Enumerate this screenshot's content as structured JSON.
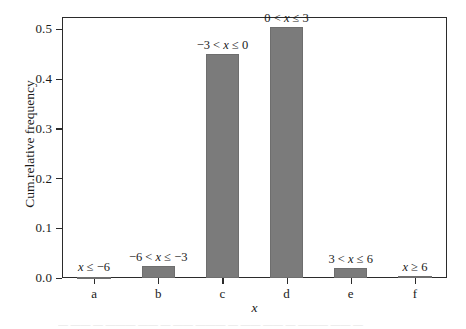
{
  "chart_data": {
    "type": "bar",
    "title": "",
    "xlabel": "x",
    "ylabel": "Cum.relative frequency",
    "categories": [
      "a",
      "b",
      "c",
      "d",
      "e",
      "f"
    ],
    "values": [
      0.003,
      0.025,
      0.45,
      0.505,
      0.02,
      0.0
    ],
    "bar_labels": [
      "x ≤ −6",
      "−6 < x ≤ −3",
      "−3 < x ≤ 0",
      "0 < x ≤ 3",
      "3 < x ≤ 6",
      "x ≥ 6"
    ],
    "ylim": [
      0.0,
      0.5249
    ],
    "yticks": [
      0.0,
      0.1,
      0.2,
      0.3,
      0.4,
      0.5
    ],
    "ytick_labels": [
      "0.0",
      "0.1",
      "0.2",
      "0.3",
      "0.4",
      "0.5"
    ],
    "grid": false,
    "legend": "none",
    "bar_color": "#7b7b7b",
    "axis_color": "#2b2b2b",
    "background_color": "#ffffff"
  },
  "caption_strip": {
    "text": "— —— — ——— —— — —— ——— — —— —— — ——— —— —"
  }
}
